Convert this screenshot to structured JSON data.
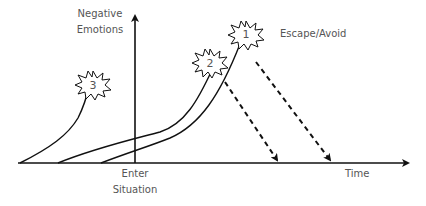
{
  "diagram": {
    "y_axis_label_line1": "Negative",
    "y_axis_label_line2": "Emotions",
    "x_axis_label": "Time",
    "enter_label_line1": "Enter",
    "enter_label_line2": "Situation",
    "escape_label": "Escape/Avoid",
    "bursts": [
      {
        "label": "1"
      },
      {
        "label": "2"
      },
      {
        "label": "3"
      }
    ],
    "colors": {
      "stroke": "#111111",
      "text": "#555555"
    }
  }
}
